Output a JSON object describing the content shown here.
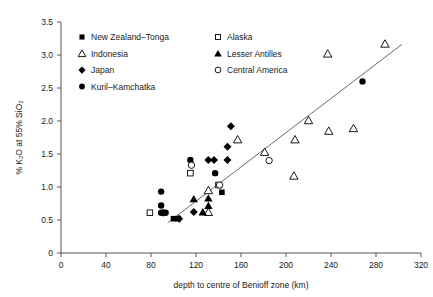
{
  "chart_data": {
    "type": "scatter",
    "title": "",
    "xlabel": "depth to centre of Benioff zone (km)",
    "ylabel": "% K₂O at 55% SiO₂",
    "xlim": [
      0,
      320
    ],
    "ylim": [
      0,
      3.5
    ],
    "xticks": [
      0,
      40,
      80,
      120,
      160,
      200,
      240,
      280,
      320
    ],
    "xtick_labels": [
      "0",
      "40",
      "80",
      "120",
      "160",
      "200",
      "240",
      "280",
      "320"
    ],
    "yticks": [
      0,
      0.5,
      1.0,
      1.5,
      2.0,
      2.5,
      3.0,
      3.5
    ],
    "ytick_labels": [
      "0",
      "0.5",
      "1.0",
      "1.5",
      "2.0",
      "2.5",
      "3.0",
      "3.5"
    ],
    "grid": false,
    "legend_position": "upper-left",
    "series": [
      {
        "name": "New Zealand–Tonga",
        "marker": "filled-square",
        "points": [
          {
            "x": 100,
            "y": 0.52
          },
          {
            "x": 104,
            "y": 0.52
          },
          {
            "x": 143,
            "y": 0.92
          }
        ]
      },
      {
        "name": "Indonesia",
        "marker": "open-triangle",
        "points": [
          {
            "x": 131,
            "y": 0.62
          },
          {
            "x": 131,
            "y": 0.95
          },
          {
            "x": 157,
            "y": 1.72
          },
          {
            "x": 181,
            "y": 1.53
          },
          {
            "x": 207,
            "y": 1.17
          },
          {
            "x": 208,
            "y": 1.72
          },
          {
            "x": 220,
            "y": 2.01
          },
          {
            "x": 237,
            "y": 3.02
          },
          {
            "x": 238,
            "y": 1.85
          },
          {
            "x": 260,
            "y": 1.89
          },
          {
            "x": 288,
            "y": 3.17
          }
        ]
      },
      {
        "name": "Japan",
        "marker": "filled-diamond",
        "points": [
          {
            "x": 91,
            "y": 0.61
          },
          {
            "x": 105,
            "y": 0.52
          },
          {
            "x": 118,
            "y": 0.62
          },
          {
            "x": 131,
            "y": 1.41
          },
          {
            "x": 136,
            "y": 1.41
          },
          {
            "x": 148,
            "y": 1.41
          },
          {
            "x": 148,
            "y": 1.61
          },
          {
            "x": 151,
            "y": 1.92
          }
        ]
      },
      {
        "name": "Kuril–Kamchatka",
        "marker": "filled-circle",
        "points": [
          {
            "x": 89,
            "y": 0.61
          },
          {
            "x": 89,
            "y": 0.72
          },
          {
            "x": 89,
            "y": 0.93
          },
          {
            "x": 93,
            "y": 0.61
          },
          {
            "x": 115,
            "y": 1.41
          },
          {
            "x": 137,
            "y": 1.21
          },
          {
            "x": 268,
            "y": 2.6
          }
        ]
      },
      {
        "name": "Alaska",
        "marker": "open-square",
        "points": [
          {
            "x": 79,
            "y": 0.61
          },
          {
            "x": 115,
            "y": 1.21
          },
          {
            "x": 140,
            "y": 1.03
          }
        ]
      },
      {
        "name": "Lesser Antilles",
        "marker": "filled-triangle",
        "points": [
          {
            "x": 118,
            "y": 0.82
          },
          {
            "x": 126,
            "y": 0.62
          },
          {
            "x": 131,
            "y": 0.72
          },
          {
            "x": 131,
            "y": 0.83
          }
        ]
      },
      {
        "name": "Central America",
        "marker": "open-circle",
        "points": [
          {
            "x": 116,
            "y": 1.33
          },
          {
            "x": 141,
            "y": 1.03
          },
          {
            "x": 185,
            "y": 1.4
          }
        ]
      }
    ],
    "trendline": {
      "x1": 95,
      "y1": 0.46,
      "x2": 303,
      "y2": 3.16
    }
  },
  "legend": {
    "column1": [
      {
        "label": "New Zealand–Tonga",
        "marker": "filled-square"
      },
      {
        "label": "Indonesia",
        "marker": "open-triangle"
      },
      {
        "label": "Japan",
        "marker": "filled-diamond"
      },
      {
        "label": "Kuril–Kamchatka",
        "marker": "filled-circle"
      }
    ],
    "column2": [
      {
        "label": "Alaska",
        "marker": "open-square"
      },
      {
        "label": "Lesser Antilles",
        "marker": "filled-triangle"
      },
      {
        "label": "Central America",
        "marker": "open-circle"
      }
    ]
  },
  "colors": {
    "marker": "#000000",
    "axis": "#555555",
    "trendline": "#6b6b6b",
    "background": "#ffffff"
  }
}
